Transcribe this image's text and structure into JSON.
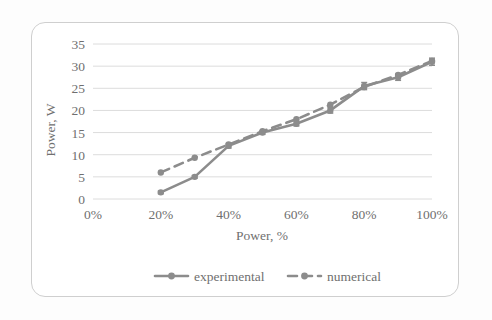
{
  "figure": {
    "caption_frame": true,
    "background_color": "#ffffff",
    "border_color": "#cfcfcf",
    "ink_color": "#8c8c8c",
    "grid_color": "#dcdcdc",
    "text_color": "#6f6f6f"
  },
  "chart_data": {
    "type": "line",
    "title": "",
    "xlabel": "Power, %",
    "ylabel": "Power, W",
    "x": [
      20,
      30,
      40,
      50,
      60,
      70,
      80,
      90,
      100
    ],
    "xtick_labels": [
      "0%",
      "20%",
      "40%",
      "60%",
      "80%",
      "100%"
    ],
    "xtick_values": [
      0,
      20,
      40,
      60,
      80,
      100
    ],
    "ytick_labels": [
      "0",
      "5",
      "10",
      "15",
      "20",
      "25",
      "30",
      "35"
    ],
    "ytick_values": [
      0,
      5,
      10,
      15,
      20,
      25,
      30,
      35
    ],
    "xlim": [
      0,
      100
    ],
    "ylim": [
      0,
      35
    ],
    "grid": "horizontal",
    "legend_position": "bottom",
    "series": [
      {
        "name": "experimental",
        "style": "solid",
        "marker": "circle",
        "has_error_bars": true,
        "values": [
          1.5,
          5.0,
          12.0,
          15.0,
          17.0,
          20.0,
          25.5,
          27.5,
          31.0
        ],
        "errors": [
          0.3,
          0.3,
          0.5,
          0.4,
          0.5,
          0.6,
          0.8,
          0.7,
          0.8
        ]
      },
      {
        "name": "numerical",
        "style": "dashed",
        "marker": "circle",
        "has_error_bars": false,
        "values": [
          6.0,
          9.3,
          12.3,
          15.3,
          18.0,
          21.3,
          25.3,
          28.0,
          31.2
        ]
      }
    ]
  },
  "legend": {
    "entries": [
      {
        "label": "experimental",
        "style": "solid"
      },
      {
        "label": "numerical",
        "style": "dashed"
      }
    ]
  }
}
